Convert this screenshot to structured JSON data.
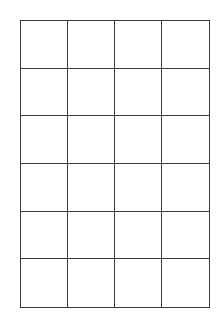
{
  "grid": {
    "columns": 4,
    "rows": 6,
    "line_color": "#3a3a3a",
    "background": "#ffffff"
  }
}
